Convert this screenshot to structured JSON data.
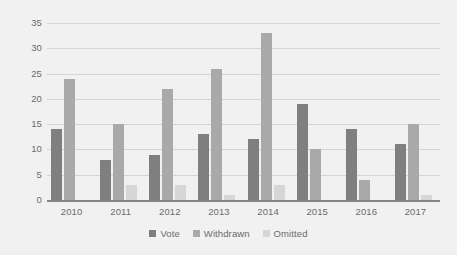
{
  "chart_data": {
    "type": "bar",
    "title": "",
    "subtitle": "",
    "xlabel": "",
    "ylabel": "",
    "categories": [
      "2010",
      "2011",
      "2012",
      "2013",
      "2014",
      "2015",
      "2016",
      "2017"
    ],
    "series": [
      {
        "name": "Vote",
        "color": "#7f7f7f",
        "values": [
          14,
          8,
          9,
          13,
          12,
          19,
          14,
          11
        ]
      },
      {
        "name": "Withdrawn",
        "color": "#a9a9a9",
        "values": [
          24,
          15,
          22,
          26,
          33,
          10,
          4,
          15
        ]
      },
      {
        "name": "Omitted",
        "color": "#d6d6d6",
        "values": [
          0,
          3,
          3,
          1,
          3,
          0,
          0,
          1
        ]
      }
    ],
    "ylim": [
      0,
      35
    ],
    "ytick_labels": [
      "0",
      "5",
      "10",
      "15",
      "20",
      "25",
      "30",
      "35"
    ],
    "ytick_values": [
      0,
      5,
      10,
      15,
      20,
      25,
      30,
      35
    ],
    "grid": "horizontal",
    "legend_position": "bottom",
    "background_color": "#f1f1f1",
    "gridline_color": "#d4d4d4",
    "axis_color": "#858585",
    "tick_label_color": "#6b6b6b"
  }
}
